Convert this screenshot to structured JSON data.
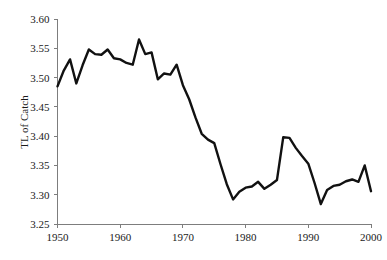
{
  "chart_data": {
    "type": "line",
    "title": "",
    "subtitle": "",
    "xlabel": "",
    "ylabel": "TL of Catch",
    "xlim": [
      1950,
      2000
    ],
    "ylim": [
      3.25,
      3.6
    ],
    "grid": false,
    "legend": null,
    "annotations": [],
    "x_ticks": [
      "1950",
      "1960",
      "1970",
      "1980",
      "1990",
      "2000"
    ],
    "x_tick_values": [
      1950,
      1960,
      1970,
      1980,
      1990,
      2000
    ],
    "y_ticks": [
      "3.25",
      "3.30",
      "3.35",
      "3.40",
      "3.45",
      "3.50",
      "3.55",
      "3.60"
    ],
    "y_tick_values": [
      3.25,
      3.3,
      3.35,
      3.4,
      3.45,
      3.5,
      3.55,
      3.6
    ],
    "line_color": "#111111",
    "axis_color": "#7d7d7d",
    "series": [
      {
        "name": "TL of Catch",
        "x": [
          1950,
          1951,
          1952,
          1953,
          1954,
          1955,
          1956,
          1957,
          1958,
          1959,
          1960,
          1961,
          1962,
          1963,
          1964,
          1965,
          1966,
          1967,
          1968,
          1969,
          1970,
          1971,
          1972,
          1973,
          1974,
          1975,
          1976,
          1977,
          1978,
          1979,
          1980,
          1981,
          1982,
          1983,
          1984,
          1985,
          1986,
          1987,
          1988,
          1989,
          1990,
          1991,
          1992,
          1993,
          1994,
          1995,
          1996,
          1997,
          1998,
          1999,
          2000
        ],
        "values": [
          3.485,
          3.512,
          3.531,
          3.49,
          3.521,
          3.548,
          3.54,
          3.539,
          3.548,
          3.533,
          3.531,
          3.525,
          3.522,
          3.565,
          3.54,
          3.543,
          3.497,
          3.507,
          3.505,
          3.522,
          3.487,
          3.463,
          3.432,
          3.404,
          3.394,
          3.388,
          3.352,
          3.318,
          3.292,
          3.305,
          3.312,
          3.314,
          3.322,
          3.31,
          3.317,
          3.325,
          3.398,
          3.397,
          3.38,
          3.366,
          3.353,
          3.32,
          3.284,
          3.308,
          3.315,
          3.317,
          3.323,
          3.326,
          3.322,
          3.35,
          3.306
        ]
      }
    ]
  },
  "axes": {
    "y_axis_title": "TL of Catch"
  }
}
